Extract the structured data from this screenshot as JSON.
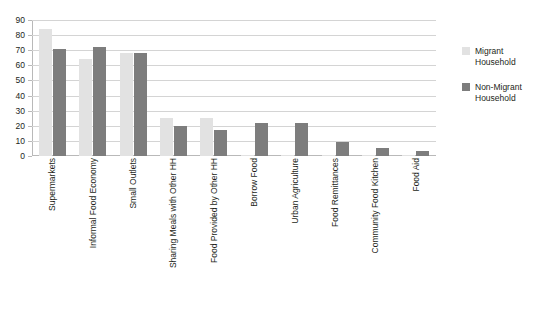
{
  "chart_data": {
    "type": "bar",
    "title": "",
    "xlabel": "",
    "ylabel": "",
    "ylim": [
      0,
      90
    ],
    "yticks": [
      0,
      10,
      20,
      30,
      40,
      50,
      60,
      70,
      80,
      90
    ],
    "grid": true,
    "legend_position": "right",
    "categories": [
      "Supermarkets",
      "Informal Food Economy",
      "Small Outlets",
      "Sharing Meals with Other HH",
      "Food Provided by Other HH",
      "Borrow Food",
      "Urban Agriculture",
      "Food Remittances",
      "Community Food Kitchen",
      "Food Aid"
    ],
    "series": [
      {
        "name": "Migrant Household",
        "color": "#e2e2e2",
        "values": [
          84,
          64,
          68,
          25,
          25,
          1,
          1,
          1,
          1,
          1
        ]
      },
      {
        "name": "Non-Migrant Household",
        "color": "#7d7d7d",
        "values": [
          71,
          72,
          68,
          20,
          17,
          22,
          22,
          9,
          5,
          3
        ]
      }
    ]
  },
  "legend": {
    "items": [
      {
        "label_line1": "Migrant",
        "label_line2": "Household",
        "swatch": "migrant"
      },
      {
        "label_line1": "Non-Migrant",
        "label_line2": "Household",
        "swatch": "nonmigrant"
      }
    ]
  },
  "clipped_title": ""
}
